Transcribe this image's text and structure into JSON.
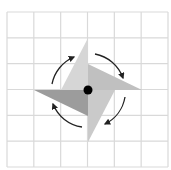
{
  "diagram": {
    "grid": {
      "rows": 6,
      "cols": 6,
      "x0": 7,
      "y0": 12,
      "x1": 168,
      "y1": 167,
      "line_color": "#d9d9d9"
    },
    "center": {
      "x": 88,
      "y": 90,
      "radius": 4.5,
      "color": "#000000"
    },
    "blades": [
      {
        "name": "top",
        "points": "88,38 88,90 61,90",
        "color": "#d6d6d6"
      },
      {
        "name": "right",
        "points": "88,64 142,90 88,90",
        "color": "#c0c0c0"
      },
      {
        "name": "bottom",
        "points": "88,90 115,90 88,142",
        "color": "#cacaca"
      },
      {
        "name": "left",
        "points": "34,90 88,90 88,116",
        "color": "#9c9c9c"
      }
    ],
    "arrows": [
      {
        "name": "top-left",
        "d": "M52,84 A37,37 0 0 1 74,57"
      },
      {
        "name": "top-right",
        "d": "M95,54 A37,37 0 0 1 123,78"
      },
      {
        "name": "bottom-right",
        "d": "M125,97 A37,37 0 0 1 105,124"
      },
      {
        "name": "bottom-left",
        "d": "M82,127 A37,37 0 0 1 53,104"
      }
    ],
    "arrow_color": "#222222",
    "rotation_direction": "clockwise"
  }
}
